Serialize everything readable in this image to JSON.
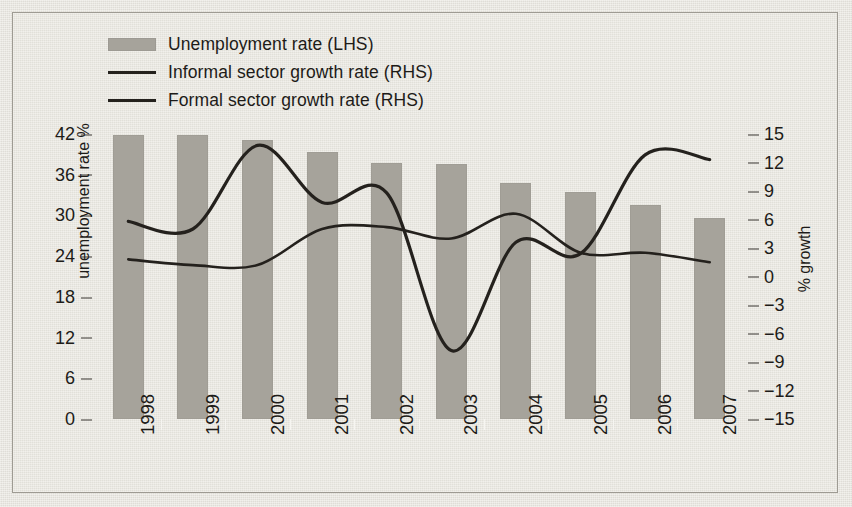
{
  "legend": {
    "items": [
      {
        "label": "Unemployment rate (LHS)",
        "marker": "bar-swatch-icon",
        "color": "#a6a39b"
      },
      {
        "label": "Informal sector growth rate (RHS)",
        "marker": "line-swatch-icon",
        "color": "#24211d"
      },
      {
        "label": "Formal sector growth rate (RHS)",
        "marker": "line-swatch-icon",
        "color": "#24211d"
      }
    ]
  },
  "axes": {
    "left_label": "unemployment rate %",
    "right_label": "% growth",
    "left_ticks": [
      "42",
      "36",
      "30",
      "24",
      "18",
      "12",
      "6",
      "0"
    ],
    "right_ticks": [
      "15",
      "12",
      "9",
      "6",
      "3",
      "0",
      "−3",
      "−6",
      "−9",
      "−12",
      "−15"
    ]
  },
  "chart_data": {
    "type": "bar",
    "title": "",
    "xlabel": "",
    "ylabel": "unemployment rate %",
    "y2label": "% growth",
    "categories": [
      "1998",
      "1999",
      "2000",
      "2001",
      "2002",
      "2003",
      "2004",
      "2005",
      "2006",
      "2007"
    ],
    "ylim": [
      0,
      42
    ],
    "y2lim": [
      -15,
      15
    ],
    "grid": false,
    "legend_position": "top-left",
    "series": [
      {
        "name": "Unemployment rate (LHS)",
        "type": "bar",
        "axis": "left",
        "color": "#a6a39b",
        "values": [
          41.8,
          41.8,
          41.1,
          39.3,
          37.8,
          37.6,
          34.8,
          33.4,
          31.6,
          29.6
        ]
      },
      {
        "name": "Informal sector growth rate (RHS)",
        "type": "line",
        "axis": "right",
        "color": "#24211d",
        "values": [
          5.8,
          5.0,
          13.8,
          7.8,
          8.8,
          -7.8,
          3.6,
          2.4,
          12.8,
          12.3
        ]
      },
      {
        "name": "Formal sector growth rate (RHS)",
        "type": "line",
        "axis": "right",
        "color": "#24211d",
        "values": [
          1.8,
          1.2,
          1.2,
          5.0,
          5.2,
          4.0,
          6.6,
          2.5,
          2.5,
          1.5
        ]
      }
    ]
  }
}
